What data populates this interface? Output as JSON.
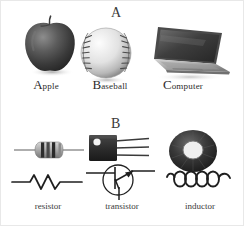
{
  "figure": {
    "background_color": "#ffffff",
    "ink_color": "#2b2b2b",
    "panels": [
      {
        "letter": "A",
        "caption_style": "small-caps",
        "items": [
          {
            "name": "apple",
            "label_cap": "A",
            "label_rest": "pple",
            "icon": "apple-photo"
          },
          {
            "name": "baseball",
            "label_cap": "B",
            "label_rest": "aseball",
            "icon": "baseball-photo"
          },
          {
            "name": "computer",
            "label_cap": "C",
            "label_rest": "omputer",
            "icon": "laptop-photo"
          }
        ]
      },
      {
        "letter": "B",
        "caption_style": "lowercase",
        "items": [
          {
            "name": "resistor",
            "label": "resistor",
            "photo": "resistor-photo",
            "symbol": "resistor-schematic-symbol"
          },
          {
            "name": "transistor",
            "label": "transistor",
            "photo": "transistor-photo",
            "symbol": "transistor-schematic-symbol"
          },
          {
            "name": "inductor",
            "label": "inductor",
            "photo": "inductor-photo",
            "symbol": "inductor-schematic-symbol"
          }
        ]
      }
    ]
  }
}
